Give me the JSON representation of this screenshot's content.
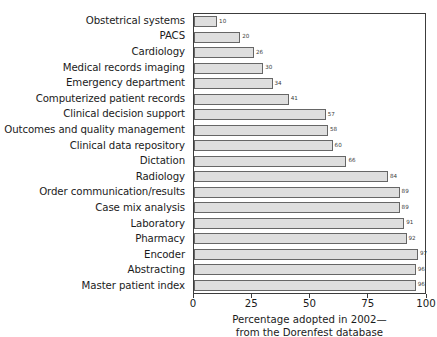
{
  "chart_data": {
    "type": "bar",
    "orientation": "horizontal",
    "title": "",
    "subtitle": "",
    "xlabel": "Percentage adopted in 2002— from the Dorenfest database",
    "ylabel": "",
    "xlim": [
      0,
      100
    ],
    "xticks": [
      0,
      25,
      50,
      75,
      100
    ],
    "xtick_labels": [
      "0",
      "25",
      "50",
      "75",
      "100"
    ],
    "grid": false,
    "legend": false,
    "legend_position": "none",
    "bar_fill_color": "#dedede",
    "bar_border_color": "#666666",
    "axis_color": "#3c3c3c",
    "text_color": "#1b1b1b",
    "background_color": "#ffffff",
    "categories": [
      "Obstetrical systems",
      "PACS",
      "Cardiology",
      "Medical records imaging",
      "Emergency department",
      "Computerized patient records",
      "Clinical decision support",
      "Outcomes and quality management",
      "Clinical data repository",
      "Dictation",
      "Radiology",
      "Order communication/results",
      "Case mix analysis",
      "Laboratory",
      "Pharmacy",
      "Encoder",
      "Abstracting",
      "Master patient index"
    ],
    "values": [
      10,
      20,
      26,
      30,
      34,
      41,
      57,
      58,
      60,
      66,
      84,
      89,
      89,
      91,
      92,
      97,
      96,
      96
    ],
    "value_labels": [
      "10",
      "20",
      "26",
      "30",
      "34",
      "41",
      "57",
      "58",
      "60",
      "66",
      "84",
      "89",
      "89",
      "91",
      "92",
      "97",
      "96",
      "96"
    ]
  },
  "caption": {
    "line1": "Percentage adopted in 2002—",
    "line2": "from the Dorenfest database"
  }
}
